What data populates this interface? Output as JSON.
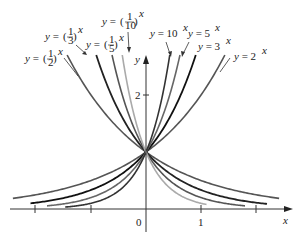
{
  "chart_data": {
    "type": "line",
    "title": "",
    "xlabel": "x",
    "ylabel": "y",
    "xlim": [
      -2.4,
      2.4
    ],
    "ylim": [
      -0.3,
      2.7
    ],
    "x_ticks": [
      -2,
      -1,
      0,
      1,
      2
    ],
    "x_tick_labels": [
      "0",
      "1"
    ],
    "y_ticks": [
      2
    ],
    "y_tick_labels": [
      "2"
    ],
    "grid": false,
    "series": [
      {
        "name": "y = 2^x",
        "base": 2,
        "color": "#555555",
        "width": 1.6
      },
      {
        "name": "y = 3^x",
        "base": 3,
        "color": "#111111",
        "width": 1.8
      },
      {
        "name": "y = 5^x",
        "base": 5,
        "color": "#666666",
        "width": 1.6
      },
      {
        "name": "y = 10^x",
        "base": 10,
        "color": "#333333",
        "width": 1.6
      },
      {
        "name": "y = (1/2)^x",
        "base": 0.5,
        "color": "#555555",
        "width": 1.6
      },
      {
        "name": "y = (1/3)^x",
        "base": 0.3333,
        "color": "#222222",
        "width": 1.8
      },
      {
        "name": "y = (1/5)^x",
        "base": 0.2,
        "color": "#555555",
        "width": 1.6
      },
      {
        "name": "y = (1/10)^x",
        "base": 0.1,
        "color": "#aaaaaa",
        "width": 1.6
      }
    ],
    "common_point": [
      0,
      1
    ]
  },
  "labels": {
    "half": {
      "prefix": "y = ",
      "num": "1",
      "den": "2",
      "exp": "x"
    },
    "third": {
      "prefix": "y = ",
      "num": "1",
      "den": "3",
      "exp": "x"
    },
    "fifth": {
      "prefix": "y = ",
      "num": "1",
      "den": "5",
      "exp": "x"
    },
    "tenth": {
      "prefix": "y = ",
      "num": "1",
      "den": "10",
      "exp": "x"
    },
    "ten": {
      "text": "y = 10",
      "exp": "x"
    },
    "five": {
      "text": "y = 5",
      "exp": "x"
    },
    "three": {
      "text": "y = 3",
      "exp": "x"
    },
    "two": {
      "text": "y = 2",
      "exp": "x"
    }
  },
  "axes": {
    "x_label": "x",
    "y_label": "y",
    "origin_label": "0",
    "x_one_label": "1",
    "y_two_label": "2"
  }
}
